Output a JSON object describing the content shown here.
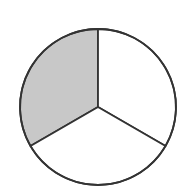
{
  "diagram": {
    "type": "fraction-circle",
    "total_parts": 3,
    "shaded_parts": 1,
    "fraction": "1/3",
    "colors": {
      "shaded": "#c8c8c8",
      "unshaded": "#ffffff",
      "stroke": "#333333"
    }
  }
}
